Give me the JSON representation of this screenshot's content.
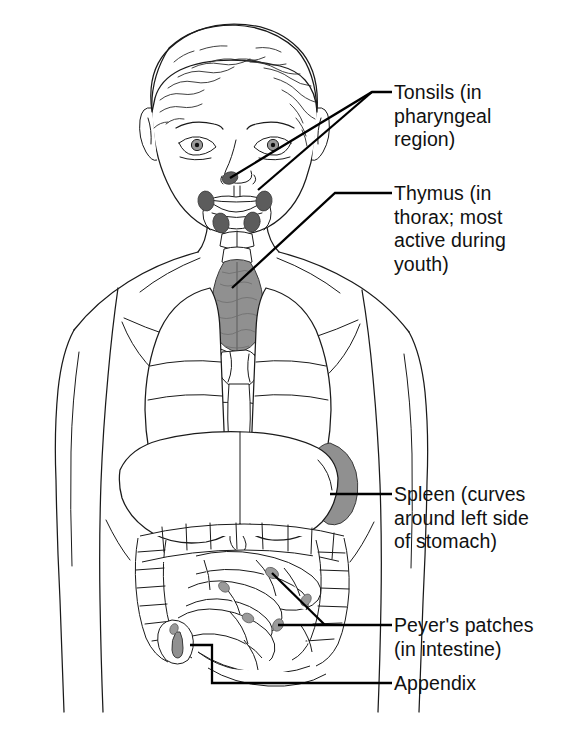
{
  "figure": {
    "background_color": "#ffffff",
    "line_color": "#1a1a1a",
    "organ_fill": "#8f8f8f",
    "tonsil_fill": "#5a5a5a"
  },
  "labels": {
    "tonsils": "Tonsils (in\npharyngeal\nregion)",
    "thymus": "Thymus (in\nthorax; most\nactive during\nyouth)",
    "spleen": "Spleen (curves\naround left side\nof stomach)",
    "peyers": "Peyer's patches\n(in intestine)",
    "appendix": "Appendix"
  },
  "organs": [
    {
      "name": "tonsils",
      "label": "Tonsils (in pharyngeal region)",
      "location": "pharyngeal region",
      "marker_count": 5
    },
    {
      "name": "thymus",
      "label": "Thymus (in thorax; most active during youth)",
      "location": "thorax"
    },
    {
      "name": "spleen",
      "label": "Spleen (curves around left side of stomach)",
      "location": "left side of stomach"
    },
    {
      "name": "peyers-patches",
      "label": "Peyer's patches (in intestine)",
      "location": "intestine"
    },
    {
      "name": "appendix",
      "label": "Appendix",
      "location": "lower right abdomen"
    }
  ],
  "leaders": [
    {
      "name": "tonsils-leader-upper",
      "from": [
        230,
        178
      ],
      "to": [
        392,
        92
      ]
    },
    {
      "name": "tonsils-leader-lower",
      "from": [
        258,
        188
      ],
      "to": [
        392,
        92
      ]
    },
    {
      "name": "thymus-leader",
      "from": [
        232,
        288
      ],
      "to": [
        392,
        193
      ]
    },
    {
      "name": "spleen-leader",
      "from": [
        330,
        494
      ],
      "to": [
        392,
        494
      ]
    },
    {
      "name": "peyers-leader-upper",
      "from": [
        272,
        573
      ],
      "to": [
        392,
        625
      ]
    },
    {
      "name": "peyers-leader-lower",
      "from": [
        278,
        625
      ],
      "to": [
        392,
        625
      ]
    },
    {
      "name": "appendix-leader",
      "from": [
        190,
        645
      ],
      "to": [
        392,
        683
      ]
    }
  ]
}
